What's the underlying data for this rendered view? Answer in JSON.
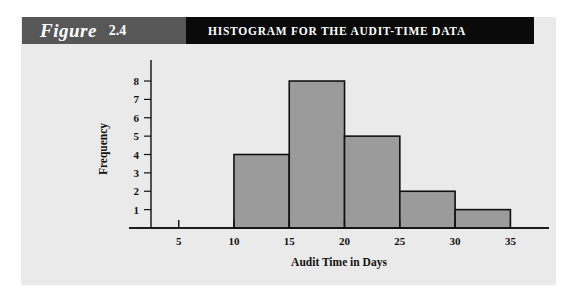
{
  "figure": {
    "word": "Figure",
    "number": "2.4",
    "title": "HISTOGRAM FOR THE AUDIT-TIME DATA"
  },
  "colors": {
    "header_tag_bg": "#575757",
    "header_title_bg": "#0a0a0a",
    "panel_bg": "#eaeaea",
    "bar_fill": "#9b9b9b",
    "bar_stroke": "#111111",
    "page_bg": "#ffffff"
  },
  "chart_data": {
    "type": "bar",
    "title": "HISTOGRAM FOR THE AUDIT-TIME DATA",
    "xlabel": "Audit Time in Days",
    "ylabel": "Frequency",
    "categories": [
      "10-15",
      "15-20",
      "20-25",
      "25-30",
      "30-35"
    ],
    "bin_edges": [
      10,
      15,
      20,
      25,
      30,
      35
    ],
    "values": [
      4,
      8,
      5,
      2,
      1
    ],
    "xlim": [
      2.5,
      36.5
    ],
    "ylim": [
      0,
      8.6
    ],
    "x_ticks": [
      5,
      10,
      15,
      20,
      25,
      30,
      35
    ],
    "x_tick_labels": [
      "5",
      "10",
      "15",
      "20",
      "25",
      "30",
      "35"
    ],
    "y_ticks": [
      1,
      2,
      3,
      4,
      5,
      6,
      7,
      8
    ],
    "y_tick_labels": [
      "1",
      "2",
      "3",
      "4",
      "5",
      "6",
      "7",
      "8"
    ],
    "grid": false,
    "legend": false
  }
}
